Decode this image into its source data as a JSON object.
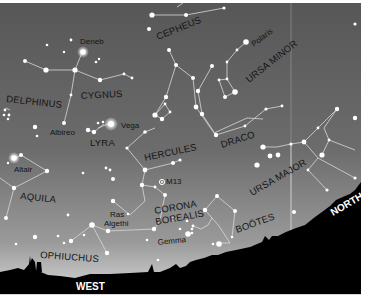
{
  "chart": {
    "type": "star-chart",
    "sky_colors": {
      "top": "#575757",
      "mid": "#7a7a7a",
      "horizon": "#d2d2d2"
    },
    "ground_color": "#000000",
    "line_color": "#d8d8d8",
    "star_color": "#ffffff"
  },
  "constellations": [
    {
      "name": "CEPHEUS",
      "x": 158,
      "y": 40,
      "rotate": -22
    },
    {
      "name": "URSA MINOR",
      "x": 249,
      "y": 83,
      "rotate": -38
    },
    {
      "name": "DELPHINUS",
      "x": 6,
      "y": 102,
      "rotate": 6
    },
    {
      "name": "CYGNUS",
      "x": 81,
      "y": 99,
      "rotate": -3
    },
    {
      "name": "LYRA",
      "x": 90,
      "y": 146,
      "rotate": 0
    },
    {
      "name": "HERCULES",
      "x": 145,
      "y": 161,
      "rotate": -12
    },
    {
      "name": "DRACO",
      "x": 222,
      "y": 148,
      "rotate": -18
    },
    {
      "name": "URSA MAJOR",
      "x": 252,
      "y": 196,
      "rotate": -30
    },
    {
      "name": "AQUILA",
      "x": 20,
      "y": 199,
      "rotate": 6
    },
    {
      "name": "CORONA",
      "x": 155,
      "y": 214,
      "rotate": -10
    },
    {
      "name": "BOREALIS",
      "x": 156,
      "y": 225,
      "rotate": -10
    },
    {
      "name": "BOÖTES",
      "x": 237,
      "y": 233,
      "rotate": -20
    },
    {
      "name": "OPHIUCHUS",
      "x": 40,
      "y": 258,
      "rotate": 4
    }
  ],
  "star_names": [
    {
      "name": "Deneb",
      "x": 80,
      "y": 44
    },
    {
      "name": "Polaris",
      "x": 254,
      "y": 47,
      "rotate": -38
    },
    {
      "name": "Albireo",
      "x": 50,
      "y": 135
    },
    {
      "name": "Vega",
      "x": 121,
      "y": 128
    },
    {
      "name": "Altair",
      "x": 14,
      "y": 172
    },
    {
      "name": "M13",
      "x": 166,
      "y": 184
    },
    {
      "name": "Ras",
      "x": 110,
      "y": 217
    },
    {
      "name": "Algethi",
      "x": 104,
      "y": 226
    },
    {
      "name": "Gemma",
      "x": 158,
      "y": 245,
      "rotate": -6
    }
  ],
  "directions": [
    {
      "name": "WEST",
      "x": 76,
      "y": 290
    },
    {
      "name": "NORTH",
      "x": 333,
      "y": 216,
      "rotate": -30
    }
  ]
}
